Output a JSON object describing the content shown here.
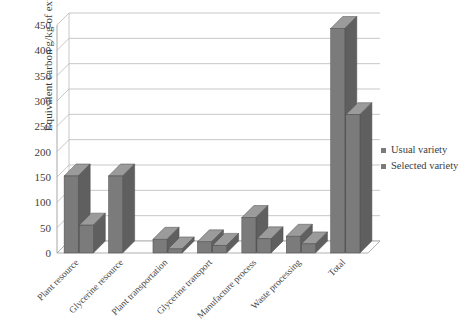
{
  "chart_data": {
    "type": "bar",
    "title": "",
    "xlabel": "",
    "ylabel": "Equivalent carbon g/kg of extract",
    "ylim": [
      0,
      450
    ],
    "ytick_step": 50,
    "yticks": [
      0,
      50,
      100,
      150,
      200,
      250,
      300,
      350,
      400,
      450
    ],
    "grid": true,
    "style": "3d-clustered-column",
    "legend_position": "right",
    "categories": [
      "Plant resource",
      "Glycerine resource",
      "Plant transportation",
      "Glycerine transport",
      "Manufacture process",
      "Waste processing",
      "Total"
    ],
    "series": [
      {
        "name": "Usual variety",
        "color": "#7b7b7b",
        "values": [
          152,
          152,
          27,
          22,
          70,
          33,
          443
        ]
      },
      {
        "name": "Selected variety",
        "color": "#7b7b7b",
        "values": [
          55,
          0,
          8,
          15,
          28,
          18,
          273
        ]
      }
    ]
  },
  "legend": {
    "items": [
      {
        "label": "Usual variety"
      },
      {
        "label": "Selected variety"
      }
    ]
  },
  "axis": {
    "y_title": "Equivalent carbon g/kg of extract"
  }
}
